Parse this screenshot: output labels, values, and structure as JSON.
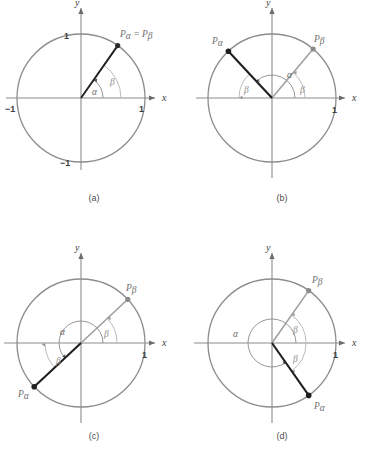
{
  "figure": {
    "colors": {
      "circle_stroke": "#8c8c8c",
      "axis_stroke": "#8c8c8c",
      "alpha_ray": "#1a1a1a",
      "beta_ray": "#9a9a9a",
      "arc_alpha": "#7d7d7d",
      "arc_beta": "#b0b0b0",
      "text": "#4a4a4a",
      "background": "#ffffff"
    },
    "panels": [
      {
        "id": "a",
        "caption": "(a)",
        "axis_x_label": "x",
        "axis_y_label": "y",
        "tick_labels": {
          "x_right": "1",
          "x_left": "−1",
          "y_top": "1",
          "y_bottom": "−1"
        },
        "point_label": "Pα = Pβ",
        "point_label_parts": {
          "p1": "P",
          "s1": "α",
          "eq": " = ",
          "p2": "P",
          "s2": "β"
        },
        "angles": [
          {
            "name": "α",
            "label": "α",
            "start_deg": 0,
            "end_deg": 55,
            "radius": 22
          },
          {
            "name": "β",
            "label": "β",
            "start_deg": 0,
            "end_deg": 55,
            "radius": 40
          }
        ],
        "rays": [
          {
            "name": "Pα",
            "angle_deg": 55,
            "style": "alpha"
          }
        ],
        "alpha_deg": 55,
        "beta_deg": 55,
        "note": "alpha and beta are coterminal; terminal points coincide"
      },
      {
        "id": "b",
        "caption": "(b)",
        "axis_x_label": "x",
        "axis_y_label": "y",
        "tick_labels": {
          "x_right": "1"
        },
        "point_labels": [
          {
            "p": "P",
            "sub": "α"
          },
          {
            "p": "P",
            "sub": "β"
          }
        ],
        "angles": [
          {
            "name": "α",
            "label": "α",
            "start_deg": 0,
            "end_deg": 133,
            "radius": 23
          },
          {
            "name": "β-right",
            "label": "β",
            "start_deg": 0,
            "end_deg": 50,
            "radius": 33
          },
          {
            "name": "β-left",
            "label": "β",
            "start_deg": 180,
            "end_deg": 133,
            "radius": 33
          }
        ],
        "alpha_deg": 133,
        "beta_deg": 50
      },
      {
        "id": "c",
        "caption": "(c)",
        "axis_x_label": "x",
        "axis_y_label": "y",
        "tick_labels": {
          "x_right": "1"
        },
        "point_labels": [
          {
            "p": "P",
            "sub": "β"
          },
          {
            "p": "P",
            "sub": "α"
          }
        ],
        "angles": [
          {
            "name": "α",
            "label": "α",
            "start_deg": 0,
            "end_deg": 223,
            "radius": 22
          },
          {
            "name": "β-right",
            "label": "β",
            "start_deg": 0,
            "end_deg": 43,
            "radius": 36
          },
          {
            "name": "β-left",
            "label": "β",
            "start_deg": 180,
            "end_deg": 223,
            "radius": 36
          }
        ],
        "alpha_deg": 223,
        "beta_deg": 43
      },
      {
        "id": "d",
        "caption": "(d)",
        "axis_x_label": "x",
        "axis_y_label": "y",
        "tick_labels": {
          "x_right": "1"
        },
        "point_labels": [
          {
            "p": "P",
            "sub": "β"
          },
          {
            "p": "P",
            "sub": "α"
          }
        ],
        "angles": [
          {
            "name": "α",
            "label": "α",
            "start_deg": 0,
            "end_deg": 305,
            "radius": 24
          },
          {
            "name": "β-upper",
            "label": "β",
            "start_deg": 0,
            "end_deg": 55,
            "radius": 34
          },
          {
            "name": "β-lower",
            "label": "β",
            "start_deg": 0,
            "end_deg": -55,
            "radius": 34
          }
        ],
        "alpha_deg": 305,
        "beta_deg": 55
      }
    ]
  }
}
